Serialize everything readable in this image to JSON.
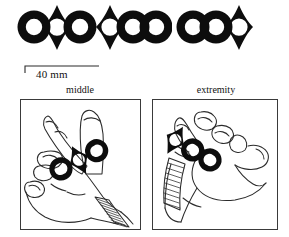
{
  "figure": {
    "type": "archaeological-illustration"
  },
  "artifacts": {
    "caption_none": "",
    "items": [
      {
        "id": "artifact-a",
        "name": "ornament-lozenge-center",
        "lozenge_position": "center",
        "rings": 2,
        "total_elements": 3
      },
      {
        "id": "artifact-b",
        "name": "ornament-lozenge-left",
        "lozenge_position": "left",
        "rings": 2,
        "total_elements": 3
      },
      {
        "id": "artifact-c",
        "name": "ornament-lozenge-right",
        "lozenge_position": "right",
        "rings": 2,
        "total_elements": 3
      }
    ]
  },
  "scale": {
    "label": "40 mm",
    "value": 40,
    "unit": "mm"
  },
  "panels": [
    {
      "id": "panel-middle",
      "label": "middle",
      "hand": "right-hand-outline",
      "ornament_placement": "middle-phalanges"
    },
    {
      "id": "panel-extremity",
      "label": "extremity",
      "hand": "left-hand-outline",
      "ornament_placement": "proximal-extremity"
    }
  ],
  "colors": {
    "ink": "#111111",
    "artifact_fill": "#0d0d0d",
    "panel_border": "#3a3a3a",
    "background": "#ffffff",
    "line": "#2b2b2b"
  }
}
